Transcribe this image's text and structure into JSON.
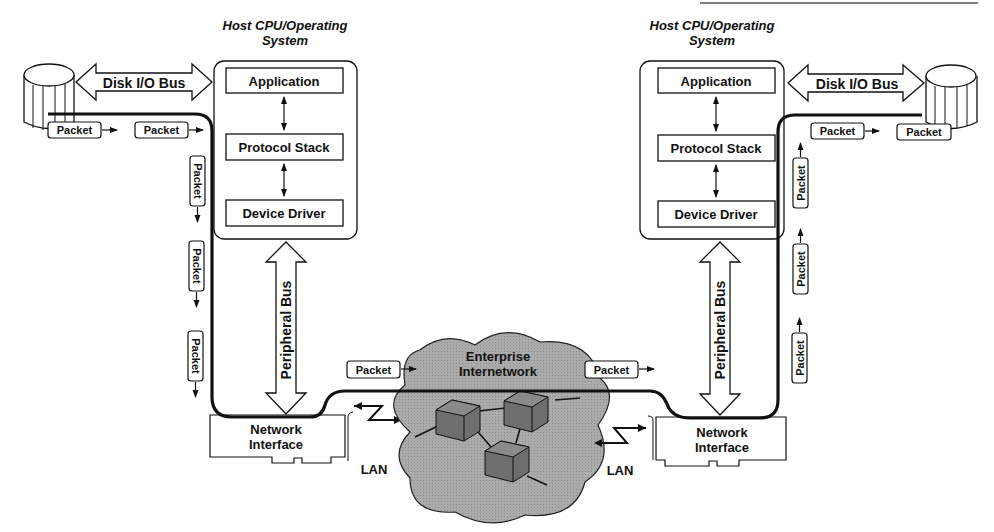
{
  "colors": {
    "ink": "#111111",
    "cloud_fill": "#a9a9a9",
    "router_fill": "#7d7d7d",
    "background": "#ffffff"
  },
  "left_host": {
    "title_line1": "Host CPU/Operating",
    "title_line2": "System",
    "layers": [
      "Application",
      "Protocol Stack",
      "Device Driver"
    ],
    "disk_bus_label": "Disk I/O Bus",
    "peripheral_bus_label": "Peripheral Bus",
    "nic_line1": "Network",
    "nic_line2": "Interface",
    "lan_label": "LAN"
  },
  "right_host": {
    "title_line1": "Host CPU/Operating",
    "title_line2": "System",
    "layers": [
      "Application",
      "Protocol Stack",
      "Device Driver"
    ],
    "disk_bus_label": "Disk I/O Bus",
    "peripheral_bus_label": "Peripheral Bus",
    "nic_line1": "Network",
    "nic_line2": "Interface",
    "lan_label": "LAN"
  },
  "cloud": {
    "line1": "Enterprise",
    "line2": "Internetwork"
  },
  "packet_label": "Packet"
}
